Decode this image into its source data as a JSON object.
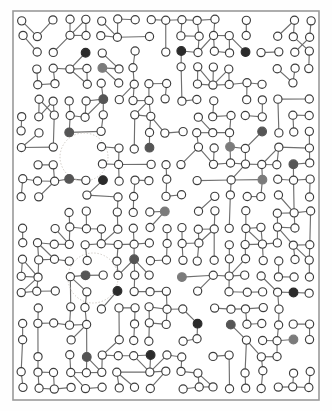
{
  "figure": {
    "background_color": "#fefefe"
  },
  "frame": {
    "x": 13,
    "y": 11,
    "width": 306,
    "height": 389,
    "stroke_color": "#9a9a9a",
    "stroke_width": 1.6,
    "fill_color": "#ffffff"
  },
  "style": {
    "edge_color": "#6f6f6f",
    "edge_width": 1.15,
    "node_radius": 4.1,
    "node_stroke_color": "#3d3d3d",
    "node_stroke_width": 1.15,
    "node_fill_default": "#ffffff",
    "node_fill_dark": "#2b2b2b",
    "node_fill_gray": "#7b7b7b",
    "node_fill_midgray": "#555555",
    "annotation_circle_color": "#c9c4bd",
    "annotation_circle_width": 0.9
  },
  "chart_data": {
    "type": "scatter",
    "xlabel": "",
    "ylabel": "",
    "xlim": [
      13,
      319
    ],
    "ylim": [
      11,
      400
    ],
    "grid": false,
    "legend": null,
    "node_count": 404,
    "edge_count": 445,
    "highlight_count": 24,
    "node_classes": [
      {
        "name": "default",
        "fill": "#ffffff",
        "count": 380
      },
      {
        "name": "dark",
        "fill": "#2b2b2b",
        "count": 8
      },
      {
        "name": "midgray",
        "fill": "#555555",
        "count": 10
      },
      {
        "name": "gray",
        "fill": "#7b7b7b",
        "count": 6
      }
    ],
    "annotations": [
      {
        "type": "circle",
        "cx": 84,
        "cy": 157,
        "r": 24,
        "label": "cluster-highlight-upper"
      },
      {
        "type": "circle",
        "cx": 93,
        "cy": 278,
        "r": 25,
        "label": "cluster-highlight-lower"
      }
    ],
    "grid_spacing_x": 16,
    "grid_spacing_y": 16,
    "nodes": [
      [
        30,
        27,
        "d"
      ],
      [
        46,
        27,
        "d"
      ],
      [
        78,
        27,
        "d"
      ],
      [
        110,
        27,
        "d"
      ],
      [
        126,
        27,
        "d"
      ],
      [
        174,
        27,
        "d"
      ],
      [
        206,
        27,
        "d"
      ],
      [
        238,
        27,
        "d"
      ],
      [
        270,
        27,
        "d"
      ],
      [
        302,
        27,
        "d"
      ],
      [
        30,
        43,
        "d"
      ],
      [
        62,
        43,
        "d"
      ],
      [
        78,
        43,
        "d"
      ],
      [
        110,
        43,
        "d"
      ],
      [
        142,
        43,
        "d"
      ],
      [
        190,
        43,
        "d"
      ],
      [
        222,
        43,
        "d"
      ],
      [
        254,
        43,
        "d"
      ],
      [
        286,
        43,
        "d"
      ],
      [
        46,
        59,
        "d"
      ],
      [
        62,
        59,
        "d"
      ],
      [
        94,
        59,
        "d"
      ],
      [
        92,
        47,
        "k"
      ],
      [
        126,
        59,
        "d"
      ],
      [
        158,
        59,
        "d"
      ],
      [
        174,
        59,
        "d"
      ],
      [
        206,
        59,
        "d"
      ],
      [
        238,
        59,
        "d"
      ],
      [
        270,
        59,
        "d"
      ],
      [
        302,
        59,
        "d"
      ],
      [
        30,
        75,
        "d"
      ],
      [
        62,
        75,
        "d"
      ],
      [
        78,
        75,
        "d"
      ],
      [
        110,
        75,
        "d"
      ],
      [
        142,
        75,
        "d"
      ],
      [
        158,
        75,
        "d"
      ],
      [
        190,
        75,
        "d"
      ],
      [
        222,
        75,
        "d"
      ],
      [
        254,
        75,
        "d"
      ],
      [
        286,
        75,
        "d"
      ],
      [
        46,
        91,
        "d"
      ],
      [
        78,
        91,
        "d"
      ],
      [
        106,
        70,
        "g"
      ],
      [
        126,
        91,
        "d"
      ],
      [
        158,
        91,
        "d"
      ],
      [
        174,
        91,
        "d"
      ],
      [
        206,
        91,
        "d"
      ],
      [
        238,
        91,
        "d"
      ],
      [
        270,
        91,
        "d"
      ],
      [
        302,
        91,
        "d"
      ],
      [
        30,
        107,
        "d"
      ],
      [
        62,
        107,
        "d"
      ],
      [
        94,
        107,
        "d"
      ],
      [
        110,
        107,
        "d"
      ],
      [
        142,
        107,
        "d"
      ],
      [
        174,
        107,
        "d"
      ],
      [
        190,
        107,
        "d"
      ],
      [
        222,
        107,
        "d"
      ],
      [
        254,
        107,
        "d"
      ],
      [
        286,
        107,
        "d"
      ],
      [
        46,
        123,
        "d"
      ],
      [
        78,
        123,
        "d"
      ],
      [
        110,
        123,
        "d"
      ],
      [
        126,
        123,
        "d"
      ],
      [
        158,
        123,
        "d"
      ],
      [
        190,
        123,
        "d"
      ],
      [
        206,
        123,
        "d"
      ],
      [
        238,
        123,
        "d"
      ],
      [
        270,
        123,
        "d"
      ],
      [
        302,
        123,
        "d"
      ],
      [
        30,
        139,
        "d"
      ],
      [
        62,
        139,
        "d"
      ],
      [
        94,
        139,
        "d"
      ],
      [
        126,
        139,
        "d"
      ],
      [
        158,
        139,
        "d"
      ],
      [
        174,
        139,
        "d"
      ],
      [
        206,
        139,
        "d"
      ],
      [
        238,
        139,
        "d"
      ],
      [
        254,
        139,
        "d"
      ],
      [
        286,
        139,
        "d"
      ],
      [
        46,
        155,
        "d"
      ],
      [
        78,
        155,
        "d"
      ],
      [
        110,
        155,
        "d"
      ],
      [
        142,
        155,
        "d"
      ],
      [
        174,
        155,
        "d"
      ],
      [
        190,
        155,
        "d"
      ],
      [
        222,
        155,
        "d"
      ],
      [
        254,
        155,
        "d"
      ],
      [
        286,
        155,
        "d"
      ],
      [
        302,
        155,
        "d"
      ],
      [
        30,
        171,
        "d"
      ],
      [
        62,
        171,
        "d"
      ],
      [
        94,
        171,
        "d"
      ],
      [
        126,
        171,
        "d"
      ],
      [
        158,
        171,
        "d"
      ],
      [
        190,
        171,
        "d"
      ],
      [
        206,
        171,
        "d"
      ],
      [
        238,
        171,
        "d"
      ],
      [
        270,
        171,
        "d"
      ],
      [
        302,
        171,
        "d"
      ],
      [
        46,
        187,
        "d"
      ],
      [
        78,
        187,
        "d"
      ],
      [
        110,
        187,
        "d"
      ],
      [
        142,
        187,
        "d"
      ],
      [
        174,
        187,
        "d"
      ],
      [
        206,
        187,
        "d"
      ],
      [
        222,
        187,
        "d"
      ],
      [
        254,
        187,
        "d"
      ],
      [
        286,
        187,
        "d"
      ],
      [
        30,
        203,
        "d"
      ],
      [
        62,
        203,
        "d"
      ],
      [
        94,
        203,
        "d"
      ],
      [
        126,
        203,
        "d"
      ],
      [
        158,
        203,
        "d"
      ],
      [
        190,
        203,
        "d"
      ],
      [
        222,
        203,
        "d"
      ],
      [
        254,
        203,
        "d"
      ],
      [
        270,
        203,
        "d"
      ],
      [
        302,
        203,
        "d"
      ],
      [
        46,
        219,
        "d"
      ],
      [
        78,
        219,
        "d"
      ],
      [
        110,
        219,
        "d"
      ],
      [
        142,
        219,
        "d"
      ],
      [
        174,
        219,
        "d"
      ],
      [
        206,
        219,
        "d"
      ],
      [
        238,
        219,
        "d"
      ],
      [
        270,
        219,
        "d"
      ],
      [
        286,
        219,
        "d"
      ],
      [
        30,
        235,
        "d"
      ],
      [
        62,
        235,
        "d"
      ],
      [
        94,
        235,
        "d"
      ],
      [
        126,
        235,
        "d"
      ],
      [
        158,
        235,
        "d"
      ],
      [
        190,
        235,
        "d"
      ],
      [
        222,
        235,
        "d"
      ],
      [
        254,
        235,
        "d"
      ],
      [
        286,
        235,
        "d"
      ],
      [
        302,
        235,
        "d"
      ],
      [
        46,
        251,
        "d"
      ],
      [
        78,
        251,
        "d"
      ],
      [
        110,
        251,
        "d"
      ],
      [
        142,
        251,
        "d"
      ],
      [
        174,
        251,
        "d"
      ],
      [
        206,
        251,
        "d"
      ],
      [
        238,
        251,
        "d"
      ],
      [
        270,
        251,
        "d"
      ],
      [
        302,
        251,
        "d"
      ],
      [
        30,
        267,
        "d"
      ],
      [
        62,
        267,
        "d"
      ],
      [
        94,
        267,
        "d"
      ],
      [
        126,
        267,
        "d"
      ],
      [
        158,
        267,
        "d"
      ],
      [
        190,
        267,
        "d"
      ],
      [
        222,
        267,
        "d"
      ],
      [
        254,
        267,
        "d"
      ],
      [
        286,
        267,
        "d"
      ],
      [
        46,
        283,
        "d"
      ],
      [
        78,
        283,
        "d"
      ],
      [
        110,
        283,
        "d"
      ],
      [
        142,
        283,
        "d"
      ],
      [
        174,
        283,
        "d"
      ],
      [
        206,
        283,
        "d"
      ],
      [
        238,
        283,
        "d"
      ],
      [
        270,
        283,
        "d"
      ],
      [
        302,
        283,
        "d"
      ],
      [
        30,
        299,
        "d"
      ],
      [
        62,
        299,
        "d"
      ],
      [
        94,
        299,
        "d"
      ],
      [
        126,
        299,
        "d"
      ],
      [
        158,
        299,
        "d"
      ],
      [
        190,
        299,
        "d"
      ],
      [
        222,
        299,
        "d"
      ],
      [
        254,
        299,
        "d"
      ],
      [
        286,
        299,
        "d"
      ],
      [
        46,
        315,
        "d"
      ],
      [
        78,
        315,
        "d"
      ],
      [
        110,
        315,
        "d"
      ],
      [
        142,
        315,
        "d"
      ],
      [
        174,
        315,
        "d"
      ],
      [
        206,
        315,
        "d"
      ],
      [
        238,
        315,
        "d"
      ],
      [
        270,
        315,
        "d"
      ],
      [
        302,
        315,
        "d"
      ],
      [
        30,
        331,
        "d"
      ],
      [
        62,
        331,
        "d"
      ],
      [
        94,
        331,
        "d"
      ],
      [
        126,
        331,
        "d"
      ],
      [
        158,
        331,
        "d"
      ],
      [
        190,
        331,
        "d"
      ],
      [
        222,
        331,
        "d"
      ],
      [
        254,
        331,
        "d"
      ],
      [
        286,
        331,
        "d"
      ],
      [
        46,
        347,
        "d"
      ],
      [
        78,
        347,
        "d"
      ],
      [
        110,
        347,
        "d"
      ],
      [
        142,
        347,
        "d"
      ],
      [
        174,
        347,
        "d"
      ],
      [
        206,
        347,
        "d"
      ],
      [
        238,
        347,
        "d"
      ],
      [
        270,
        347,
        "d"
      ],
      [
        302,
        347,
        "d"
      ],
      [
        30,
        363,
        "d"
      ],
      [
        62,
        363,
        "d"
      ],
      [
        94,
        363,
        "d"
      ],
      [
        126,
        363,
        "d"
      ],
      [
        158,
        363,
        "d"
      ],
      [
        190,
        363,
        "d"
      ],
      [
        222,
        363,
        "d"
      ],
      [
        254,
        363,
        "d"
      ],
      [
        286,
        363,
        "d"
      ],
      [
        46,
        379,
        "d"
      ],
      [
        78,
        379,
        "d"
      ],
      [
        110,
        379,
        "d"
      ],
      [
        142,
        379,
        "d"
      ],
      [
        174,
        379,
        "d"
      ],
      [
        206,
        379,
        "d"
      ],
      [
        238,
        379,
        "d"
      ],
      [
        270,
        379,
        "d"
      ],
      [
        302,
        379,
        "d"
      ],
      [
        30,
        391,
        "d"
      ],
      [
        94,
        391,
        "d"
      ],
      [
        158,
        391,
        "d"
      ],
      [
        222,
        391,
        "d"
      ],
      [
        286,
        391,
        "d"
      ]
    ],
    "highlight_nodes": [
      [
        92,
        47,
        "k"
      ],
      [
        174,
        47,
        "k"
      ],
      [
        238,
        59,
        "k"
      ],
      [
        106,
        70,
        "g"
      ],
      [
        103,
        99,
        "m"
      ],
      [
        62,
        131,
        "m"
      ],
      [
        152,
        152,
        "m"
      ],
      [
        225,
        152,
        "g"
      ],
      [
        289,
        158,
        "m"
      ],
      [
        108,
        181,
        "k"
      ],
      [
        71,
        193,
        "m"
      ],
      [
        262,
        180,
        "g"
      ],
      [
        181,
        211,
        "g"
      ],
      [
        86,
        268,
        "m"
      ],
      [
        129,
        262,
        "m"
      ],
      [
        104,
        293,
        "k"
      ],
      [
        176,
        280,
        "g"
      ],
      [
        231,
        330,
        "m"
      ],
      [
        200,
        323,
        "k"
      ],
      [
        148,
        352,
        "k"
      ],
      [
        86,
        362,
        "m"
      ],
      [
        262,
        138,
        "m"
      ],
      [
        290,
        300,
        "k"
      ],
      [
        300,
        345,
        "g"
      ]
    ]
  }
}
